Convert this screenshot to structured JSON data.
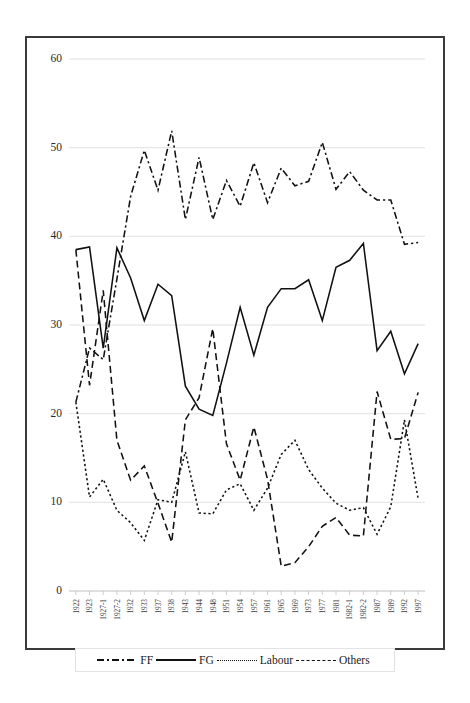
{
  "chart_data": {
    "type": "line",
    "title": "",
    "xlabel": "",
    "ylabel": "",
    "ylim": [
      0,
      60
    ],
    "ytick_values": [
      0,
      10,
      20,
      30,
      40,
      50,
      60
    ],
    "ytick_labels": [
      "0",
      "10",
      "20",
      "30",
      "40",
      "50",
      "60"
    ],
    "grid": true,
    "legend_position": "bottom",
    "categories": [
      "1922",
      "1923",
      "1927-1",
      "1927-2",
      "1932",
      "1933",
      "1937",
      "1938",
      "1943",
      "1944",
      "1948",
      "1951",
      "1954",
      "1957",
      "1961",
      "1965",
      "1969",
      "1973",
      "1977",
      "1981",
      "1982-1",
      "1982-2",
      "1987",
      "1989",
      "1992",
      "1997"
    ],
    "series": [
      {
        "name": "FF",
        "style": "dash-dot",
        "color": "#111111",
        "values": [
          21.3,
          27.4,
          26.1,
          35.2,
          44.5,
          49.7,
          45.2,
          51.9,
          41.9,
          48.9,
          41.9,
          46.3,
          43.4,
          48.3,
          43.8,
          47.7,
          45.7,
          46.2,
          50.6,
          45.3,
          47.3,
          45.2,
          44.1,
          44.1,
          39.1,
          39.3
        ]
      },
      {
        "name": "FG",
        "style": "solid",
        "color": "#111111",
        "values": [
          38.5,
          38.8,
          27.4,
          38.7,
          35.3,
          30.5,
          34.6,
          33.3,
          23.1,
          20.5,
          19.8,
          25.7,
          32.0,
          26.6,
          32.0,
          34.1,
          34.1,
          35.1,
          30.5,
          36.5,
          37.3,
          39.2,
          27.1,
          29.3,
          24.5,
          27.9
        ]
      },
      {
        "name": "Labour",
        "style": "dotted",
        "color": "#111111",
        "values": [
          21.3,
          10.6,
          12.6,
          9.1,
          7.7,
          5.7,
          10.3,
          10.0,
          15.7,
          8.8,
          8.7,
          11.4,
          12.1,
          9.1,
          11.6,
          15.4,
          17.0,
          13.7,
          11.6,
          9.9,
          9.1,
          9.4,
          6.4,
          9.5,
          19.3,
          10.4
        ]
      },
      {
        "name": "Others",
        "style": "dashed",
        "color": "#111111",
        "values": [
          38.5,
          23.2,
          33.9,
          17.0,
          12.5,
          14.1,
          9.9,
          5.5,
          19.3,
          21.8,
          29.6,
          16.6,
          12.5,
          18.5,
          12.6,
          2.8,
          3.2,
          5.0,
          7.3,
          8.3,
          6.3,
          6.2,
          22.5,
          17.1,
          17.2,
          22.4
        ]
      }
    ]
  },
  "legend": {
    "entries": [
      {
        "label": "FF",
        "style": "dash-dot"
      },
      {
        "label": "FG",
        "style": "solid"
      },
      {
        "label": "Labour",
        "style": "dotted"
      },
      {
        "label": "Others",
        "style": "dashed"
      }
    ]
  }
}
